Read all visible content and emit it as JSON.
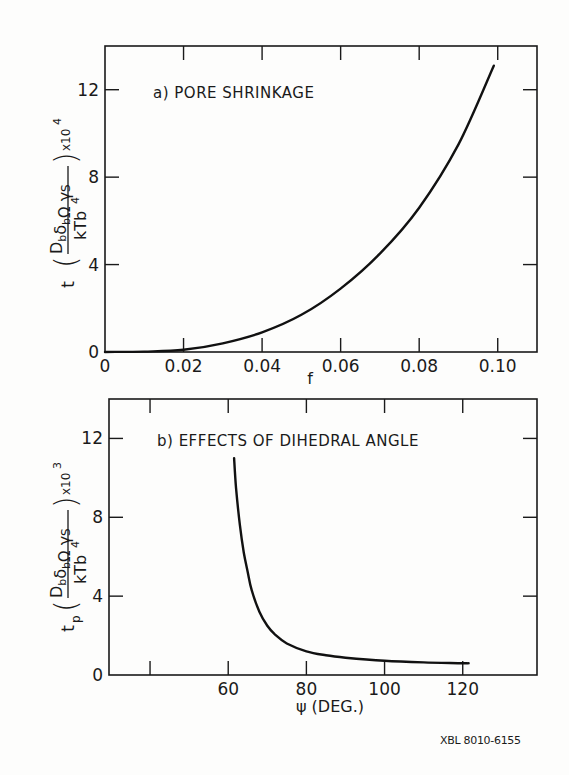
{
  "figure_id": "XBL 8010-6155",
  "chart_data": [
    {
      "type": "line",
      "panel": "a",
      "title": "a) PORE SHRINKAGE",
      "xlabel": "f",
      "ylabel": "t (D_b δ_b Ω γ_S / k T b^4) × 10^4",
      "ylabel_parts": {
        "prefix": "t",
        "numerator": "DₕδₕΩ γS",
        "denominator": "kTb⁴",
        "multiplier": "x10⁴"
      },
      "xlim": [
        0,
        0.11
      ],
      "ylim": [
        0,
        14
      ],
      "xticks": [
        0,
        0.02,
        0.04,
        0.06,
        0.08,
        0.1
      ],
      "xtick_labels": [
        "0",
        "0.02",
        "0.04",
        "0.06",
        "0.08",
        "0.10"
      ],
      "yticks": [
        0,
        4,
        8,
        12
      ],
      "ytick_labels": [
        "0",
        "4",
        "8",
        "12"
      ],
      "grid": false,
      "series": [
        {
          "name": "pore shrinkage",
          "x": [
            0,
            0.01,
            0.02,
            0.03,
            0.04,
            0.05,
            0.06,
            0.07,
            0.08,
            0.09,
            0.099
          ],
          "y": [
            0,
            0.02,
            0.1,
            0.4,
            0.9,
            1.7,
            2.9,
            4.5,
            6.6,
            9.5,
            13.1
          ]
        }
      ]
    },
    {
      "type": "line",
      "panel": "b",
      "title": "b) EFFECTS OF DIHEDRAL ANGLE",
      "xlabel": "ψ (DEG.)",
      "ylabel": "t_p (D_b δ_b Ω γ_S / k T b^4) × 10^3",
      "ylabel_parts": {
        "prefix": "tp",
        "numerator": "DₕδₕΩ γS",
        "denominator": "kTb⁴",
        "multiplier": "x10³"
      },
      "xlim": [
        29.5,
        139
      ],
      "ylim": [
        0,
        14
      ],
      "xticks": [
        40,
        60,
        80,
        100,
        120
      ],
      "xtick_labels": [
        "",
        "60",
        "80",
        "100",
        "120"
      ],
      "yticks": [
        0,
        4,
        8,
        12
      ],
      "ytick_labels": [
        "0",
        "4",
        "8",
        "12"
      ],
      "grid": false,
      "series": [
        {
          "name": "dihedral angle effect",
          "x": [
            61.5,
            62,
            63,
            64,
            65,
            66,
            68,
            70,
            72,
            75,
            80,
            85,
            90,
            100,
            110,
            120,
            121.5
          ],
          "y": [
            11.0,
            9.5,
            7.6,
            6.2,
            5.2,
            4.3,
            3.2,
            2.5,
            2.05,
            1.6,
            1.2,
            1.0,
            0.88,
            0.72,
            0.64,
            0.6,
            0.6
          ]
        }
      ]
    }
  ]
}
